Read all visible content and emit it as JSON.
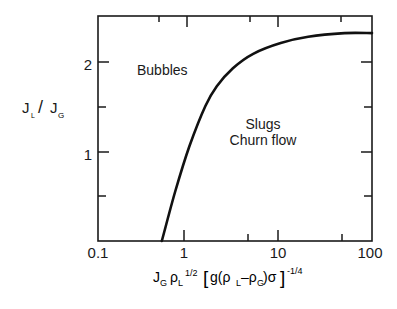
{
  "chart_data": {
    "type": "line",
    "title": "",
    "xlabel": "J_G ρ_L^(1/2) [g(ρ_L−ρ_G)σ]^(−1/4)",
    "ylabel": "J_L / J_G",
    "xscale": "log",
    "xlim": [
      0.1,
      100
    ],
    "ylim": [
      0,
      2.5
    ],
    "grid": false,
    "legend": null,
    "x_ticks": [
      0.1,
      1,
      10,
      100
    ],
    "x_tick_labels": [
      "0.1",
      "1",
      "10",
      "100"
    ],
    "y_ticks": [
      1,
      2
    ],
    "y_tick_labels": [
      "1",
      "2"
    ],
    "series": [
      {
        "name": "Bubble / slug-churn transition boundary",
        "x": [
          0.5,
          0.7,
          1.0,
          1.5,
          2.0,
          3.0,
          5.0,
          10.0,
          20.0,
          50.0,
          100.0
        ],
        "y": [
          0.0,
          0.55,
          1.05,
          1.5,
          1.72,
          1.92,
          2.08,
          2.2,
          2.27,
          2.31,
          2.31
        ]
      }
    ],
    "annotations": [
      {
        "text": "Bubbles",
        "x": 0.45,
        "y": 1.9
      },
      {
        "text": "Slugs",
        "x": 7,
        "y": 1.05
      },
      {
        "text": "Churn flow",
        "x": 7,
        "y": 0.88
      }
    ]
  },
  "labels": {
    "y_axis": {
      "main": "J",
      "sub1": "L",
      "slash": "/",
      "main2": "J",
      "sub2": "G"
    },
    "x_axis": {
      "jg": "J",
      "jg_sub": "G",
      "rho": "ρ",
      "rho_sub": "L",
      "rho_sup": "1/2",
      "bracket_open": "[",
      "g": "g(ρ",
      "l_sub": "L",
      "minus": "–ρ",
      "g_sub": "G",
      "close": ")σ",
      "bracket_close": "]",
      "exp": "-1/4"
    },
    "regions": {
      "bubbles": "Bubbles",
      "slugs": "Slugs",
      "churn": "Churn flow"
    },
    "ticks": {
      "x0": "0.1",
      "x1": "1",
      "x2": "10",
      "x3": "100",
      "y1": "1",
      "y2": "2"
    }
  }
}
